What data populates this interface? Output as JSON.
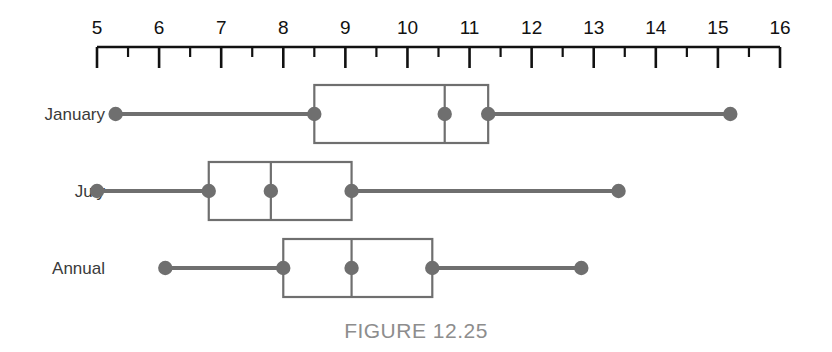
{
  "caption": "FIGURE 12.25",
  "chart_data": {
    "type": "box",
    "title": "FIGURE 12.25",
    "xlabel": "",
    "ylabel": "",
    "orientation": "horizontal",
    "xlim": [
      5,
      16
    ],
    "grid": false,
    "legend": "none",
    "axis": {
      "min": 5,
      "max": 16,
      "major_step": 1,
      "minor_step": 0.5,
      "tick_labels": [
        "5",
        "6",
        "7",
        "8",
        "9",
        "10",
        "11",
        "12",
        "13",
        "14",
        "15",
        "16"
      ]
    },
    "categories": [
      "January",
      "July",
      "Annual"
    ],
    "boxes": [
      {
        "label": "January",
        "min": 5.3,
        "q1": 8.5,
        "median": 10.6,
        "q3": 11.3,
        "max": 15.2
      },
      {
        "label": "July",
        "min": 5.0,
        "q1": 6.8,
        "median": 7.8,
        "q3": 9.1,
        "max": 13.4
      },
      {
        "label": "Annual",
        "min": 6.1,
        "q1": 8.0,
        "median": 9.1,
        "q3": 10.4,
        "max": 12.8
      }
    ]
  },
  "colors": {
    "axis": "#111111",
    "box": "#6f6f6f",
    "whisker": "#6f6f6f",
    "marker": "#6f6f6f",
    "label_text": "#3a3a3a",
    "caption_text": "#8d8d8d",
    "background": "#ffffff"
  }
}
